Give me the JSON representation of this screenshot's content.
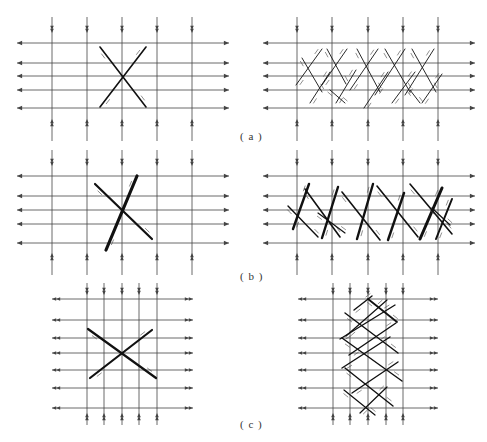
{
  "figure": {
    "line_color": "#444444",
    "thick_color": "#111111",
    "labels": [
      {
        "id": "a",
        "text": "( a )",
        "x": 240,
        "y": 130
      },
      {
        "id": "b",
        "text": "( b )",
        "x": 240,
        "y": 270
      },
      {
        "id": "c",
        "text": "( c )",
        "x": 240,
        "y": 418
      }
    ],
    "panels": [
      {
        "id": "a-left",
        "vlines": [
          52,
          87,
          122,
          157,
          192
        ],
        "v_top": 17,
        "v_bottom": 141,
        "v_arrow_top": 30,
        "v_arrow_bottom": 122,
        "hlines": [
          43,
          63,
          76,
          90,
          108
        ],
        "h_left": 17,
        "h_right": 229,
        "h_arrow": "outward-single",
        "faults": [
          {
            "x1": 100,
            "y1": 47,
            "x2": 146,
            "y2": 107,
            "w": 1.6
          },
          {
            "x1": 146,
            "y1": 47,
            "x2": 100,
            "y2": 107,
            "w": 1.6
          }
        ]
      },
      {
        "id": "a-right",
        "vlines": [
          297,
          332,
          368,
          403,
          438
        ],
        "v_top": 17,
        "v_bottom": 141,
        "v_arrow_top": 30,
        "v_arrow_bottom": 122,
        "hlines": [
          43,
          63,
          76,
          90,
          108
        ],
        "h_left": 263,
        "h_right": 475,
        "h_arrow": "outward-single",
        "faults": [
          {
            "x1": 302,
            "y1": 58,
            "x2": 322,
            "y2": 92,
            "w": 0.9
          },
          {
            "x1": 322,
            "y1": 49,
            "x2": 296,
            "y2": 85,
            "w": 0.9
          },
          {
            "x1": 310,
            "y1": 103,
            "x2": 330,
            "y2": 72,
            "w": 0.9
          },
          {
            "x1": 327,
            "y1": 49,
            "x2": 346,
            "y2": 84,
            "w": 0.9
          },
          {
            "x1": 347,
            "y1": 49,
            "x2": 322,
            "y2": 85,
            "w": 0.9
          },
          {
            "x1": 336,
            "y1": 103,
            "x2": 356,
            "y2": 70,
            "w": 0.9
          },
          {
            "x1": 357,
            "y1": 49,
            "x2": 380,
            "y2": 92,
            "w": 0.9
          },
          {
            "x1": 378,
            "y1": 49,
            "x2": 350,
            "y2": 90,
            "w": 0.9
          },
          {
            "x1": 364,
            "y1": 108,
            "x2": 388,
            "y2": 72,
            "w": 0.9
          },
          {
            "x1": 385,
            "y1": 49,
            "x2": 410,
            "y2": 92,
            "w": 0.9
          },
          {
            "x1": 405,
            "y1": 49,
            "x2": 375,
            "y2": 95,
            "w": 0.9
          },
          {
            "x1": 392,
            "y1": 103,
            "x2": 415,
            "y2": 72,
            "w": 0.9
          },
          {
            "x1": 412,
            "y1": 49,
            "x2": 436,
            "y2": 92,
            "w": 0.9
          },
          {
            "x1": 434,
            "y1": 49,
            "x2": 405,
            "y2": 95,
            "w": 0.9
          },
          {
            "x1": 422,
            "y1": 103,
            "x2": 442,
            "y2": 74,
            "w": 0.9
          },
          {
            "x1": 330,
            "y1": 90,
            "x2": 345,
            "y2": 103,
            "w": 0.9
          },
          {
            "x1": 410,
            "y1": 90,
            "x2": 420,
            "y2": 103,
            "w": 0.9
          }
        ]
      },
      {
        "id": "b-left",
        "vlines": [
          52,
          87,
          122,
          157,
          192
        ],
        "v_top": 150,
        "v_bottom": 275,
        "v_arrow_top": 163,
        "v_arrow_bottom": 256,
        "hlines": [
          176,
          196,
          210,
          224,
          243
        ],
        "h_left": 17,
        "h_right": 229,
        "h_arrow": "outward-single",
        "faults": [
          {
            "x1": 137,
            "y1": 176,
            "x2": 106,
            "y2": 250,
            "w": 3.2
          },
          {
            "x1": 95,
            "y1": 184,
            "x2": 152,
            "y2": 239,
            "w": 2.2
          }
        ]
      },
      {
        "id": "b-right",
        "vlines": [
          297,
          332,
          368,
          403,
          438
        ],
        "v_top": 150,
        "v_bottom": 275,
        "v_arrow_top": 163,
        "v_arrow_bottom": 256,
        "hlines": [
          176,
          196,
          210,
          224,
          243
        ],
        "h_left": 263,
        "h_right": 475,
        "h_arrow": "outward-single",
        "faults": [
          {
            "x1": 309,
            "y1": 184,
            "x2": 293,
            "y2": 229,
            "w": 2.4
          },
          {
            "x1": 288,
            "y1": 206,
            "x2": 318,
            "y2": 237,
            "w": 1.4
          },
          {
            "x1": 305,
            "y1": 189,
            "x2": 340,
            "y2": 237,
            "w": 1.6
          },
          {
            "x1": 338,
            "y1": 187,
            "x2": 322,
            "y2": 238,
            "w": 2.4
          },
          {
            "x1": 318,
            "y1": 213,
            "x2": 345,
            "y2": 233,
            "w": 1.2
          },
          {
            "x1": 342,
            "y1": 192,
            "x2": 380,
            "y2": 240,
            "w": 1.6
          },
          {
            "x1": 373,
            "y1": 184,
            "x2": 357,
            "y2": 239,
            "w": 2.4
          },
          {
            "x1": 377,
            "y1": 186,
            "x2": 418,
            "y2": 237,
            "w": 1.6
          },
          {
            "x1": 404,
            "y1": 193,
            "x2": 388,
            "y2": 240,
            "w": 2.4
          },
          {
            "x1": 410,
            "y1": 184,
            "x2": 452,
            "y2": 234,
            "w": 1.6
          },
          {
            "x1": 442,
            "y1": 188,
            "x2": 420,
            "y2": 239,
            "w": 3.0
          },
          {
            "x1": 452,
            "y1": 199,
            "x2": 436,
            "y2": 239,
            "w": 2.0
          },
          {
            "x1": 432,
            "y1": 208,
            "x2": 450,
            "y2": 225,
            "w": 1.2
          }
        ]
      },
      {
        "id": "c-left",
        "vlines": [
          87,
          104,
          122,
          139,
          157
        ],
        "v_top": 283,
        "v_bottom": 425,
        "v_arrow_top": 292,
        "v_arrow_bottom": 416,
        "hlines": [
          299,
          320,
          338,
          353,
          370,
          388,
          408
        ],
        "h_left": 52,
        "h_right": 193,
        "h_arrow": "outward-double",
        "faults": [
          {
            "x1": 88,
            "y1": 329,
            "x2": 156,
            "y2": 378,
            "w": 2.2
          },
          {
            "x1": 90,
            "y1": 378,
            "x2": 152,
            "y2": 330,
            "w": 2.2
          }
        ]
      },
      {
        "id": "c-right",
        "vlines": [
          333,
          350,
          368,
          386,
          403
        ],
        "v_top": 283,
        "v_bottom": 425,
        "v_arrow_top": 292,
        "v_arrow_bottom": 416,
        "hlines": [
          299,
          320,
          338,
          353,
          370,
          388,
          408
        ],
        "h_left": 298,
        "h_right": 438,
        "h_arrow": "outward-double",
        "faults": [
          {
            "x1": 354,
            "y1": 310,
            "x2": 372,
            "y2": 296,
            "w": 1.4
          },
          {
            "x1": 368,
            "y1": 299,
            "x2": 397,
            "y2": 322,
            "w": 1.8
          },
          {
            "x1": 345,
            "y1": 313,
            "x2": 398,
            "y2": 353,
            "w": 1.4
          },
          {
            "x1": 387,
            "y1": 300,
            "x2": 346,
            "y2": 336,
            "w": 1.2
          },
          {
            "x1": 340,
            "y1": 339,
            "x2": 395,
            "y2": 305,
            "w": 1.4
          },
          {
            "x1": 342,
            "y1": 338,
            "x2": 402,
            "y2": 381,
            "w": 1.4
          },
          {
            "x1": 349,
            "y1": 355,
            "x2": 396,
            "y2": 323,
            "w": 1.4
          },
          {
            "x1": 342,
            "y1": 368,
            "x2": 390,
            "y2": 337,
            "w": 1.4
          },
          {
            "x1": 345,
            "y1": 368,
            "x2": 393,
            "y2": 406,
            "w": 1.4
          },
          {
            "x1": 352,
            "y1": 393,
            "x2": 398,
            "y2": 362,
            "w": 1.4
          },
          {
            "x1": 344,
            "y1": 390,
            "x2": 375,
            "y2": 415,
            "w": 1.2
          },
          {
            "x1": 360,
            "y1": 413,
            "x2": 387,
            "y2": 387,
            "w": 1.2
          }
        ]
      }
    ]
  }
}
